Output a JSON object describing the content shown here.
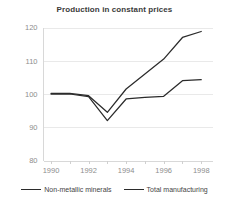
{
  "chart_data": {
    "type": "line",
    "title": "Production in constant prices",
    "xlabel": "",
    "ylabel": "",
    "x": [
      1990,
      1991,
      1992,
      1993,
      1994,
      1995,
      1996,
      1997,
      1998
    ],
    "xlim": [
      1989.6,
      1998.6
    ],
    "ylim": [
      80,
      120
    ],
    "yticks": [
      80,
      90,
      100,
      110,
      120
    ],
    "xticks": [
      1990,
      1992,
      1994,
      1996,
      1998
    ],
    "xtick_labels": [
      "1990",
      "1992",
      "1994",
      "1996",
      "1998"
    ],
    "ytick_labels": [
      "80",
      "90",
      "100",
      "110",
      "120"
    ],
    "grid": true,
    "legend_position": "bottom",
    "series": [
      {
        "name": "Non-metallic minerals",
        "color": "#2b2b2b",
        "values": [
          100.0,
          100.0,
          99.2,
          92.0,
          98.5,
          99.0,
          99.3,
          104.0,
          104.3
        ]
      },
      {
        "name": "Total manufacturing",
        "color": "#2b2b2b",
        "values": [
          100.2,
          100.2,
          99.5,
          94.5,
          101.5,
          106.0,
          110.5,
          117.0,
          118.8
        ]
      }
    ]
  },
  "legend": {
    "items": [
      {
        "label": "Non-metallic minerals",
        "color": "#2b2b2b"
      },
      {
        "label": "Total manufacturing",
        "color": "#2b2b2b"
      }
    ]
  }
}
